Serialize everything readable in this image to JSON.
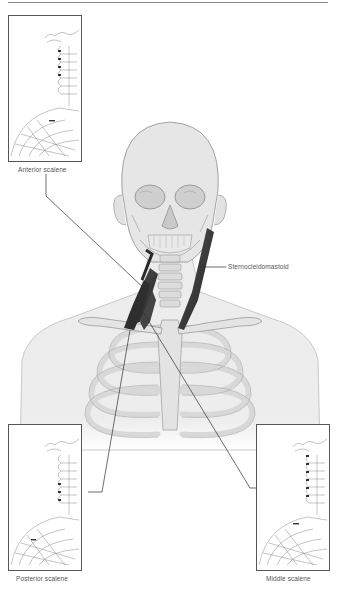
{
  "figure": {
    "type": "anatomical-illustration"
  },
  "labels": {
    "anterior_scalene": "Anterior scalene",
    "sternocleidomastoid": "Sternocleidomastoid",
    "posterior_scalene": "Posterior scalene",
    "middle_scalene": "Middle scalene"
  },
  "insets": [
    {
      "id": "anterior",
      "label": "Anterior scalene",
      "position": "top-left"
    },
    {
      "id": "posterior",
      "label": "Posterior scalene",
      "position": "bottom-left"
    },
    {
      "id": "middle",
      "label": "Middle scalene",
      "position": "bottom-right"
    }
  ],
  "colors": {
    "line": "#333333",
    "bone": "#d9d9d9",
    "bone_stroke": "#9a9a9a",
    "muscle": "#3a3a3a",
    "skin": "#ececec",
    "text": "#555555"
  }
}
